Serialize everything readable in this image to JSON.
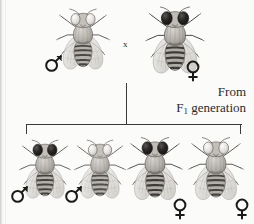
{
  "figure": {
    "background_color": "#fbfbfa",
    "line_color": "#3a3a38",
    "cross_symbol": "x",
    "caption_line1": "From",
    "caption_line2_prefix": "F",
    "caption_line2_sub": "1",
    "caption_line2_suffix": " generation"
  },
  "parents": [
    {
      "id": "parent-male",
      "sex": "male",
      "sex_symbol": "♂",
      "eye_color": "#f0eeea",
      "eye_label": "white",
      "body_color": "#b9b6b0",
      "body_shade": "light",
      "position": {
        "x": 53,
        "y": 2,
        "w": 60,
        "h": 76
      },
      "symbol_position": {
        "x": 46,
        "y": 55
      }
    },
    {
      "id": "parent-female",
      "sex": "female",
      "sex_symbol": "♀",
      "eye_color": "#201e1c",
      "eye_label": "red",
      "body_color": "#8e8b85",
      "body_shade": "dark",
      "position": {
        "x": 143,
        "y": 0,
        "w": 64,
        "h": 80
      },
      "symbol_position": {
        "x": 185,
        "y": 60
      }
    }
  ],
  "offspring": [
    {
      "id": "offspring-1",
      "sex": "male",
      "sex_symbol": "♂",
      "eye_color": "#201e1c",
      "eye_label": "red",
      "body_color": "#a6a29c",
      "body_shade": "medium",
      "position": {
        "x": 16,
        "y": 133,
        "w": 56,
        "h": 72
      },
      "symbol_position": {
        "x": 11,
        "y": 186
      }
    },
    {
      "id": "offspring-2",
      "sex": "male",
      "sex_symbol": "♂",
      "eye_color": "#efedea",
      "eye_label": "white",
      "body_color": "#b9b6b0",
      "body_shade": "light",
      "position": {
        "x": 71,
        "y": 133,
        "w": 56,
        "h": 72
      },
      "symbol_position": {
        "x": 64,
        "y": 186
      }
    },
    {
      "id": "offspring-3",
      "sex": "female",
      "sex_symbol": "♀",
      "eye_color": "#201e1c",
      "eye_label": "red",
      "body_color": "#8e8b85",
      "body_shade": "dark",
      "position": {
        "x": 125,
        "y": 130,
        "w": 60,
        "h": 78
      },
      "symbol_position": {
        "x": 172,
        "y": 199
      }
    },
    {
      "id": "offspring-4",
      "sex": "female",
      "sex_symbol": "♀",
      "eye_color": "#efedea",
      "eye_label": "white",
      "body_color": "#a39f99",
      "body_shade": "medium",
      "position": {
        "x": 186,
        "y": 130,
        "w": 60,
        "h": 78
      },
      "symbol_position": {
        "x": 234,
        "y": 199
      }
    }
  ],
  "connectors": {
    "descent_line": {
      "x": 126,
      "y": 83,
      "w": 1.4,
      "h": 41
    },
    "bracket_top": {
      "x": 26,
      "y": 124,
      "w": 216,
      "h": 1.4
    },
    "bracket_left": {
      "x": 26,
      "y": 124,
      "w": 1.4,
      "h": 10
    },
    "bracket_right": {
      "x": 240,
      "y": 124,
      "w": 1.4,
      "h": 10
    }
  }
}
